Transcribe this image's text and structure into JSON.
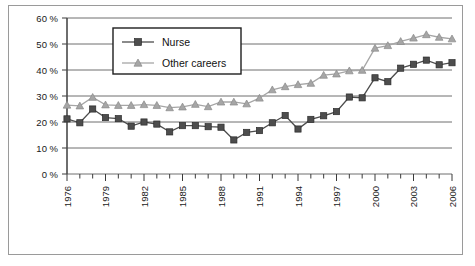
{
  "chart_data": {
    "type": "line",
    "title": "",
    "xlabel": "",
    "ylabel": "",
    "xlim": [
      1976,
      2006
    ],
    "ylim": [
      0,
      60
    ],
    "grid": true,
    "grid_axis": "y",
    "legend_position": "top-left-inside",
    "y_ticks": [
      0,
      10,
      20,
      30,
      40,
      50,
      60
    ],
    "y_tick_labels": [
      "0 %",
      "10 %",
      "20 %",
      "30 %",
      "40 %",
      "50 %",
      "60 %"
    ],
    "x": [
      1976,
      1977,
      1978,
      1979,
      1980,
      1981,
      1982,
      1983,
      1984,
      1985,
      1986,
      1987,
      1988,
      1989,
      1990,
      1991,
      1992,
      1993,
      1994,
      1995,
      1996,
      1997,
      1998,
      1999,
      2000,
      2001,
      2002,
      2003,
      2004,
      2005,
      2006
    ],
    "x_tick_labels": [
      "1976",
      "1979",
      "1982",
      "1985",
      "1988",
      "1991",
      "1994",
      "1997",
      "2000",
      "2003",
      "2006"
    ],
    "x_tick_label_rotation": -90,
    "x_tick_label_values": [
      1976,
      1979,
      1982,
      1985,
      1988,
      1991,
      1994,
      1997,
      2000,
      2003,
      2006
    ],
    "series": [
      {
        "name": "Nurse",
        "color": "#4d4d4d",
        "marker": "square",
        "values": [
          21.2,
          19.7,
          25.0,
          21.7,
          21.3,
          18.4,
          20.0,
          19.2,
          16.2,
          18.6,
          18.6,
          18.2,
          18.0,
          13.1,
          16.0,
          16.7,
          19.7,
          22.5,
          17.3,
          21.0,
          22.4,
          24.0,
          29.6,
          29.3,
          37.0,
          35.5,
          40.7,
          42.2,
          43.8,
          42.0,
          42.8
        ]
      },
      {
        "name": "Other careers",
        "color": "#a6a6a6",
        "marker": "triangle",
        "values": [
          26.5,
          26.2,
          29.5,
          26.6,
          26.4,
          26.4,
          26.7,
          26.4,
          25.5,
          25.8,
          26.8,
          25.9,
          27.7,
          27.7,
          27.0,
          29.2,
          32.4,
          33.6,
          34.4,
          34.9,
          38.0,
          38.5,
          39.7,
          39.9,
          48.4,
          49.4,
          51.0,
          52.3,
          53.6,
          52.6,
          52.0
        ]
      }
    ]
  },
  "legend": {
    "entries": [
      {
        "label": "Nurse"
      },
      {
        "label": "Other careers"
      }
    ]
  }
}
